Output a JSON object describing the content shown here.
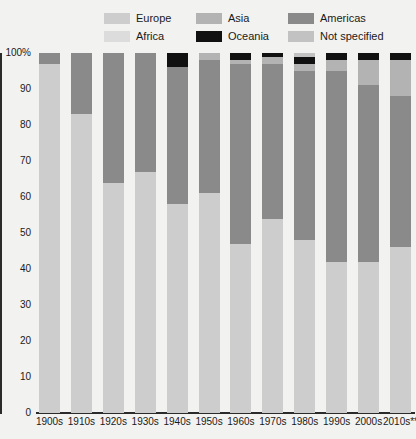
{
  "legend": {
    "items": [
      {
        "label": "Europe",
        "color": "#cdcdcd",
        "key": "europe"
      },
      {
        "label": "Asia",
        "color": "#b3b3b3",
        "key": "asia"
      },
      {
        "label": "Americas",
        "color": "#8a8a8a",
        "key": "americas"
      },
      {
        "label": "Africa",
        "color": "#dcdcdc",
        "key": "africa"
      },
      {
        "label": "Oceania",
        "color": "#111111",
        "key": "oceania"
      },
      {
        "label": "Not specified",
        "color": "#c2c2c2",
        "key": "not_specified"
      }
    ]
  },
  "chart_data": {
    "type": "bar",
    "stacked": true,
    "stack_total": 100,
    "title": "",
    "subtitle": "",
    "xlabel": "",
    "ylabel": "",
    "ylim": [
      0,
      100
    ],
    "yticks": [
      "0",
      "10",
      "20",
      "30",
      "40",
      "50",
      "60",
      "70",
      "80",
      "90",
      "100%"
    ],
    "ytick_values": [
      0,
      10,
      20,
      30,
      40,
      50,
      60,
      70,
      80,
      90,
      100
    ],
    "grid": false,
    "legend_position": "top",
    "categories": [
      "1900s",
      "1910s",
      "1920s",
      "1930s",
      "1940s",
      "1950s",
      "1960s",
      "1970s",
      "1980s",
      "1990s",
      "2000s",
      "2010s**"
    ],
    "series": [
      {
        "name": "Europe",
        "color": "#cdcdcd",
        "values": [
          97,
          83,
          64,
          67,
          58,
          61,
          47,
          54,
          48,
          42,
          42,
          46
        ]
      },
      {
        "name": "Americas",
        "color": "#8a8a8a",
        "values": [
          3,
          17,
          36,
          33,
          38,
          37,
          50,
          43,
          47,
          53,
          49,
          42
        ]
      },
      {
        "name": "Asia",
        "color": "#b3b3b3",
        "values": [
          0,
          0,
          0,
          0,
          0,
          2,
          1,
          2,
          2,
          3,
          7,
          10
        ]
      },
      {
        "name": "Oceania",
        "color": "#111111",
        "values": [
          0,
          0,
          0,
          0,
          4,
          0,
          2,
          1,
          2,
          2,
          2,
          2
        ]
      },
      {
        "name": "Not specified",
        "color": "#c2c2c2",
        "values": [
          0,
          0,
          0,
          0,
          0,
          0,
          0,
          0,
          1,
          0,
          0,
          0
        ]
      },
      {
        "name": "Africa",
        "color": "#dcdcdc",
        "values": [
          0,
          0,
          0,
          0,
          0,
          0,
          0,
          0,
          0,
          0,
          0,
          0
        ]
      }
    ],
    "stack_order": [
      "Europe",
      "Americas",
      "Asia",
      "Oceania",
      "Not specified",
      "Africa"
    ]
  }
}
